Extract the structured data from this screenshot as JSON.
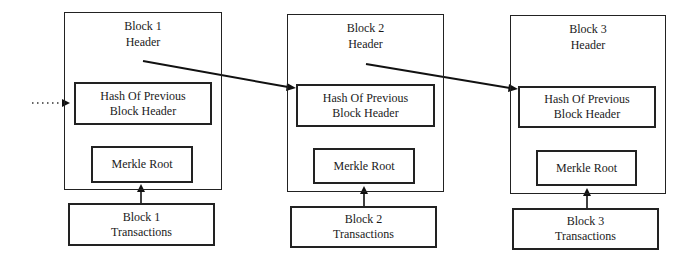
{
  "diagram": {
    "type": "blockchain-structure",
    "incoming_link": {
      "style": "dotted",
      "target": "block1.hash_prev"
    },
    "blocks": [
      {
        "header_line1": "Block 1",
        "header_line2": "Header",
        "hash_prev_line1": "Hash Of Previous",
        "hash_prev_line2": "Block Header",
        "merkle_root": "Merkle Root",
        "transactions_line1": "Block 1",
        "transactions_line2": "Transactions"
      },
      {
        "header_line1": "Block 2",
        "header_line2": "Header",
        "hash_prev_line1": "Hash Of Previous",
        "hash_prev_line2": "Block Header",
        "merkle_root": "Merkle Root",
        "transactions_line1": "Block 2",
        "transactions_line2": "Transactions"
      },
      {
        "header_line1": "Block 3",
        "header_line2": "Header",
        "hash_prev_line1": "Hash Of Previous",
        "hash_prev_line2": "Block Header",
        "merkle_root": "Merkle Root",
        "transactions_line1": "Block 3",
        "transactions_line2": "Transactions"
      }
    ],
    "edges": [
      {
        "from": "block1.header",
        "to": "block2.hash_prev"
      },
      {
        "from": "block2.header",
        "to": "block3.hash_prev"
      },
      {
        "from": "block1.transactions",
        "to": "block1.merkle_root"
      },
      {
        "from": "block2.transactions",
        "to": "block2.merkle_root"
      },
      {
        "from": "block3.transactions",
        "to": "block3.merkle_root"
      }
    ],
    "colors": {
      "line": "#222222",
      "background": "#ffffff"
    }
  }
}
